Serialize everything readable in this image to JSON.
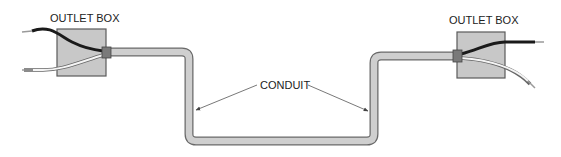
{
  "labels": {
    "left_box": "OUTLET BOX",
    "right_box": "OUTLET BOX",
    "conduit": "CONDUIT"
  },
  "colors": {
    "box_fill": "#c8c8c8",
    "box_stroke": "#5a5a5a",
    "conduit_fill": "#cfcfcf",
    "conduit_stroke": "#6a6a6a",
    "connector": "#7a7a7a",
    "hot_wire": "#1a1a1a",
    "neutral_wire": "#f4f4f4",
    "neutral_outline": "#666666",
    "stripped_end": "#9a9a9a",
    "leader_line": "#555555"
  },
  "components": [
    {
      "id": "left-outlet-box",
      "type": "outlet-box"
    },
    {
      "id": "right-outlet-box",
      "type": "outlet-box"
    },
    {
      "id": "conduit",
      "type": "conduit"
    },
    {
      "id": "hot-wire",
      "type": "wire",
      "color_name": "black"
    },
    {
      "id": "neutral-wire",
      "type": "wire",
      "color_name": "white"
    }
  ]
}
